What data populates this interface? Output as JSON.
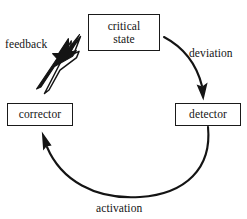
{
  "diagram": {
    "canvas": {
      "width": 247,
      "height": 219,
      "background": "#ffffff"
    },
    "ink_color": "#141414",
    "nodes": [
      {
        "id": "critical-state",
        "label": "critical\nstate",
        "shape": "rectangle"
      },
      {
        "id": "corrector",
        "label": "corrector",
        "shape": "rectangle"
      },
      {
        "id": "detector",
        "label": "detector",
        "shape": "rectangle"
      }
    ],
    "edges": [
      {
        "id": "deviation",
        "label": "deviation",
        "from": "critical-state",
        "to": "detector",
        "style": "curved-arrow",
        "arrowhead": "filled"
      },
      {
        "id": "activation",
        "label": "activation",
        "from": "detector",
        "to": "corrector",
        "style": "curved-arrow",
        "arrowhead": "filled"
      },
      {
        "id": "feedback",
        "label": "feedback",
        "from": "corrector",
        "to": "critical-state",
        "style": "double-arrow",
        "arrowhead": "one-solid-one-outlined"
      }
    ]
  }
}
